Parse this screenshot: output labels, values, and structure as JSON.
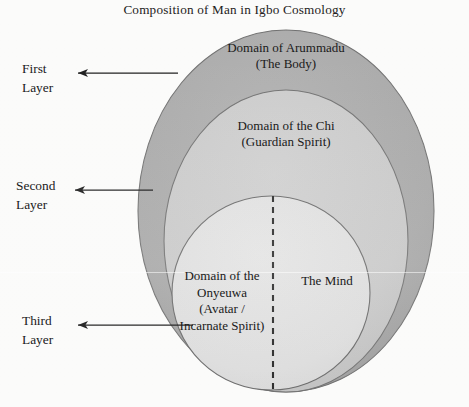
{
  "figure": {
    "title": "Composition of Man in Igbo Cosmology",
    "background_color": "#fbfbfa"
  },
  "layers": [
    {
      "id": "outer",
      "side_label_line1": "First",
      "side_label_line2": "Layer",
      "domain_line1": "Domain of Arummadu",
      "domain_line2": "(The Body)",
      "fill_color": "#a9a9a9",
      "stroke_color": "#6f6f6f"
    },
    {
      "id": "middle",
      "side_label_line1": "Second",
      "side_label_line2": "Layer",
      "domain_line1": "Domain of the Chi",
      "domain_line2": "(Guardian Spirit)",
      "fill_color": "#c9c9c9",
      "stroke_color": "#717171"
    },
    {
      "id": "inner",
      "side_label_line1": "Third",
      "side_label_line2": "Layer",
      "domain_line1": "Domain of the",
      "domain_line2": "Onyeuwa",
      "domain_line3": "(Avatar /",
      "domain_line4": "Incarnate Spirit)",
      "mind_label": "The Mind",
      "fill_color": "#dedede",
      "stroke_color": "#6b6b6b"
    }
  ],
  "annotations": {
    "divider_style": "dashed-vertical",
    "arrow_color": "#1a1a1a"
  }
}
